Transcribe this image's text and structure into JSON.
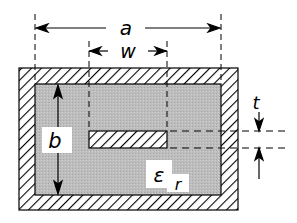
{
  "diagram": {
    "type": "shielded stripline cross-section",
    "labels": {
      "a": "a",
      "w": "w",
      "b": "b",
      "t": "t",
      "epsilon": "ε",
      "epsilon_sub": "r"
    },
    "colors": {
      "conductor_hatch": "#000000",
      "conductor_bg": "#ffffff",
      "dielectric": "#b8b8b8",
      "line": "#000000"
    }
  }
}
